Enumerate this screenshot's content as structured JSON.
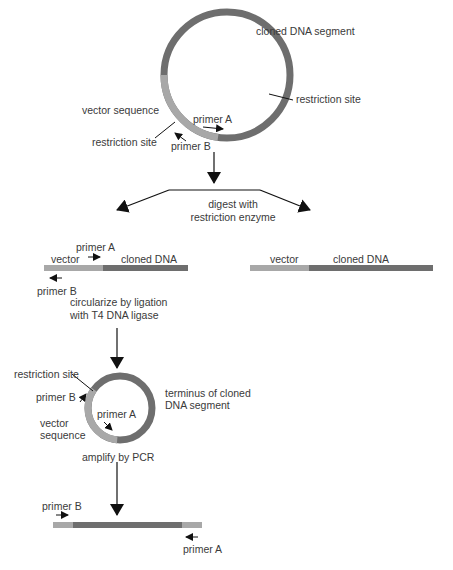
{
  "colors": {
    "vector": "#a8a8a8",
    "cloned": "#6e6e6e",
    "line": "#111111",
    "text": "#3a3a3a"
  },
  "top_plasmid": {
    "cloned_label": "cloned DNA segment",
    "restriction_site_right": "restriction site",
    "vector_label": "vector sequence",
    "restriction_site_left": "restriction site",
    "primer_a": "primer A",
    "primer_b": "primer B"
  },
  "digest_step": {
    "label_line1": "digest with",
    "label_line2": "restriction enzyme"
  },
  "left_fragment": {
    "primer_a": "primer A",
    "vector": "vector",
    "cloned": "cloned DNA",
    "primer_b": "primer B"
  },
  "right_fragment": {
    "vector": "vector",
    "cloned": "cloned DNA"
  },
  "ligation_step": {
    "label_line1": "circularize by ligation",
    "label_line2": "with T4 DNA ligase"
  },
  "small_circle": {
    "restriction_site": "restriction site",
    "primer_b": "primer B",
    "primer_a": "primer A",
    "vector_line1": "vector",
    "vector_line2": "sequence",
    "terminus_line1": "terminus of cloned",
    "terminus_line2": "DNA segment"
  },
  "pcr_step": {
    "label": "amplify by PCR"
  },
  "product": {
    "primer_b": "primer B",
    "primer_a": "primer A"
  }
}
